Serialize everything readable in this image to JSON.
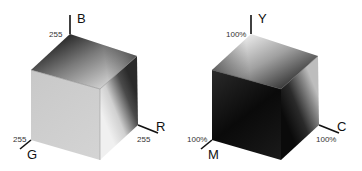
{
  "rgb_cube": {
    "axes": {
      "b": {
        "label": "B",
        "max": "255"
      },
      "r": {
        "label": "R",
        "max": "255"
      },
      "g": {
        "label": "G",
        "max": "255"
      }
    }
  },
  "cmy_cube": {
    "axes": {
      "y": {
        "label": "Y",
        "max": "100%"
      },
      "c": {
        "label": "C",
        "max": "100%"
      },
      "m": {
        "label": "M",
        "max": "100%"
      }
    }
  }
}
